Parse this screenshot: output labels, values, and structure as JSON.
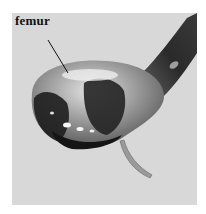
{
  "figure": {
    "annotation": "femur",
    "colors": {
      "background": "#d8d8d8",
      "specimen_light": "#b9b9b9",
      "specimen_dark": "#1e1e1e",
      "label": "#111111"
    }
  }
}
